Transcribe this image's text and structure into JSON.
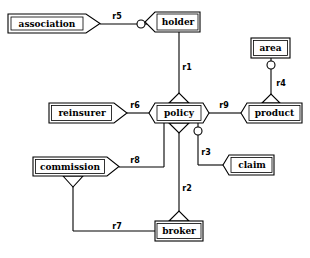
{
  "diagram": {
    "type": "entity-relationship-diagram",
    "background_color": "#ffffff",
    "line_color": "#000000",
    "fill_color": "#ffffff",
    "entities": [
      {
        "id": "association",
        "label": "association",
        "x": 8,
        "y": 14,
        "w": 86,
        "h": 19,
        "right_arrow": true,
        "left_arrow": false,
        "top_arrow": false,
        "bottom_arrow": false
      },
      {
        "id": "holder",
        "label": "holder",
        "x": 155,
        "y": 12,
        "w": 45,
        "h": 20,
        "right_arrow": false,
        "left_arrow": true,
        "top_arrow": false,
        "bottom_arrow": false
      },
      {
        "id": "area",
        "label": "area",
        "x": 251,
        "y": 38,
        "w": 39,
        "h": 20,
        "right_arrow": false,
        "left_arrow": false,
        "top_arrow": false,
        "bottom_arrow": false
      },
      {
        "id": "reinsurer",
        "label": "reinsurer",
        "x": 49,
        "y": 103,
        "w": 72,
        "h": 19,
        "right_arrow": true,
        "left_arrow": false,
        "top_arrow": false,
        "bottom_arrow": false
      },
      {
        "id": "policy",
        "label": "policy",
        "x": 155,
        "y": 103,
        "w": 48,
        "h": 20,
        "right_arrow": true,
        "left_arrow": true,
        "top_arrow": true,
        "bottom_arrow": true
      },
      {
        "id": "product",
        "label": "product",
        "x": 247,
        "y": 103,
        "w": 55,
        "h": 20,
        "right_arrow": false,
        "left_arrow": true,
        "top_arrow": true,
        "bottom_arrow": false
      },
      {
        "id": "commission",
        "label": "commission",
        "x": 33,
        "y": 157,
        "w": 80,
        "h": 19,
        "right_arrow": true,
        "left_arrow": false,
        "top_arrow": false,
        "bottom_arrow": true
      },
      {
        "id": "claim",
        "label": "claim",
        "x": 229,
        "y": 155,
        "w": 45,
        "h": 19,
        "right_arrow": false,
        "left_arrow": true,
        "top_arrow": false,
        "bottom_arrow": false
      },
      {
        "id": "broker",
        "label": "broker",
        "x": 155,
        "y": 221,
        "w": 48,
        "h": 20,
        "right_arrow": false,
        "left_arrow": false,
        "top_arrow": true,
        "bottom_arrow": false
      }
    ],
    "relationships": [
      {
        "id": "r1",
        "label": "r1",
        "from": "holder",
        "to": "policy",
        "label_x": 187,
        "label_y": 67
      },
      {
        "id": "r2",
        "label": "r2",
        "from": "policy",
        "to": "broker",
        "label_x": 187,
        "label_y": 188
      },
      {
        "id": "r3",
        "label": "r3",
        "from": "policy",
        "to": "claim",
        "label_x": 203,
        "label_y": 152
      },
      {
        "id": "r4",
        "label": "r4",
        "from": "area",
        "to": "product",
        "label_x": 281,
        "label_y": 82
      },
      {
        "id": "r5",
        "label": "r5",
        "from": "association",
        "to": "holder",
        "label_x": 117,
        "label_y": 16
      },
      {
        "id": "r6",
        "label": "r6",
        "from": "reinsurer",
        "to": "policy",
        "label_x": 133,
        "label_y": 104
      },
      {
        "id": "r7",
        "label": "r7",
        "from": "commission",
        "to": "broker",
        "label_x": 117,
        "label_y": 228
      },
      {
        "id": "r8",
        "label": "r8",
        "from": "commission",
        "to": "policy",
        "label_x": 133,
        "label_y": 161
      },
      {
        "id": "r9",
        "label": "r9",
        "from": "policy",
        "to": "product",
        "label_x": 223,
        "label_y": 104
      }
    ],
    "optionality_markers": [
      {
        "id": "opt-r5-holder",
        "on": "r5",
        "x": 141,
        "y": 24,
        "r": 4
      },
      {
        "id": "opt-r4-area",
        "on": "r4",
        "x": 271,
        "y": 65,
        "r": 4
      },
      {
        "id": "opt-r3-policy",
        "on": "r3",
        "x": 198,
        "y": 131,
        "r": 4
      }
    ]
  }
}
